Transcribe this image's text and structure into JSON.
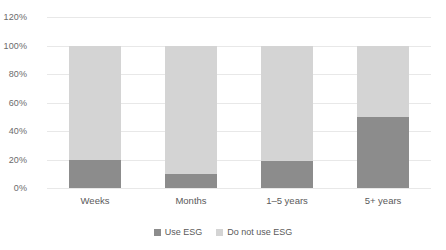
{
  "chart_data": {
    "type": "bar",
    "subtype": "100-percent-stacked-column",
    "title": "",
    "xlabel": "",
    "ylabel": "",
    "categories": [
      "Weeks",
      "Months",
      "1–5 years",
      "5+ years"
    ],
    "series": [
      {
        "name": "Use ESG",
        "values": [
          20,
          10,
          19,
          50
        ],
        "color": "#8c8c8c"
      },
      {
        "name": "Do not use ESG",
        "values": [
          80,
          90,
          81,
          50
        ],
        "color": "#d4d4d4"
      }
    ],
    "ylim": [
      0,
      120
    ],
    "ytick_values": [
      0,
      20,
      40,
      60,
      80,
      100,
      120
    ],
    "ytick_labels": [
      "0%",
      "20%",
      "40%",
      "60%",
      "80%",
      "100%",
      "120%"
    ],
    "grid": true,
    "legend_position": "bottom-center",
    "bar_total": 100
  },
  "axis": {
    "y": {
      "ticks": [
        {
          "label": "120%",
          "value": 120
        },
        {
          "label": "100%",
          "value": 100
        },
        {
          "label": "80%",
          "value": 80
        },
        {
          "label": "60%",
          "value": 60
        },
        {
          "label": "40%",
          "value": 40
        },
        {
          "label": "20%",
          "value": 20
        },
        {
          "label": "0%",
          "value": 0
        }
      ]
    },
    "x": {
      "categories": [
        {
          "label": "Weeks"
        },
        {
          "label": "Months"
        },
        {
          "label": "1–5 years"
        },
        {
          "label": "5+ years"
        }
      ]
    }
  },
  "legend": {
    "items": [
      {
        "label": "Use ESG",
        "color": "#8c8c8c"
      },
      {
        "label": "Do not use ESG",
        "color": "#d4d4d4"
      }
    ]
  },
  "colors": {
    "use_esg": "#8c8c8c",
    "do_not_use_esg": "#d4d4d4",
    "gridline": "#e8e8e8",
    "tick_text": "#6b6b6b",
    "background": "#ffffff"
  }
}
